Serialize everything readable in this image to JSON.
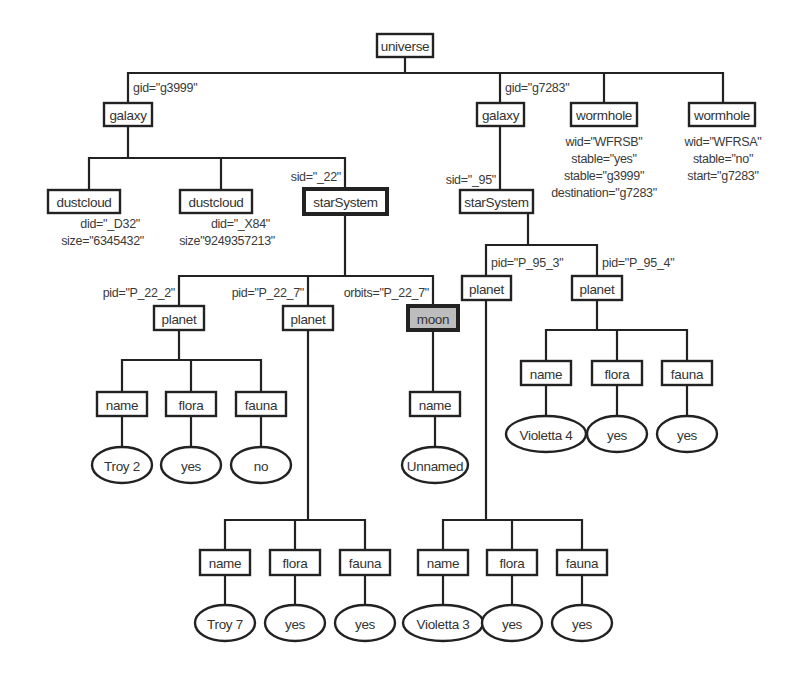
{
  "diagram": {
    "title": "",
    "colors": {
      "line": "#222222",
      "box_fill": "#ffffff",
      "highlight_fill": "#bdbdbd",
      "text": "#333333"
    },
    "nodes": [
      {
        "id": "universe",
        "label": "universe",
        "shape": "box",
        "x": 377,
        "y": 34,
        "w": 56,
        "h": 23
      },
      {
        "id": "galaxy1",
        "label": "galaxy",
        "shape": "box",
        "x": 104,
        "y": 103,
        "w": 48,
        "h": 23
      },
      {
        "id": "galaxy2",
        "label": "galaxy",
        "shape": "box",
        "x": 477,
        "y": 103,
        "w": 47,
        "h": 23
      },
      {
        "id": "wormhole1",
        "label": "wormhole",
        "shape": "box",
        "x": 571,
        "y": 103,
        "w": 66,
        "h": 23
      },
      {
        "id": "wormhole2",
        "label": "wormhole",
        "shape": "box",
        "x": 689,
        "y": 103,
        "w": 66,
        "h": 23
      },
      {
        "id": "dustcloud1",
        "label": "dustcloud",
        "shape": "box",
        "x": 48,
        "y": 190,
        "w": 72,
        "h": 23
      },
      {
        "id": "dustcloud2",
        "label": "dustcloud",
        "shape": "box",
        "x": 180,
        "y": 190,
        "w": 72,
        "h": 23
      },
      {
        "id": "starsystem1",
        "label": "starSystem",
        "shape": "box",
        "style": "bold",
        "x": 304,
        "y": 189,
        "w": 83,
        "h": 25
      },
      {
        "id": "starsystem2",
        "label": "starSystem",
        "shape": "box",
        "x": 460,
        "y": 190,
        "w": 73,
        "h": 23
      },
      {
        "id": "planet1",
        "label": "planet",
        "shape": "box",
        "x": 154,
        "y": 306,
        "w": 50,
        "h": 24
      },
      {
        "id": "planet2",
        "label": "planet",
        "shape": "box",
        "x": 283,
        "y": 306,
        "w": 50,
        "h": 24
      },
      {
        "id": "moon",
        "label": "moon",
        "shape": "box",
        "style": "shaded",
        "x": 408,
        "y": 306,
        "w": 50,
        "h": 24
      },
      {
        "id": "planet3",
        "label": "planet",
        "shape": "box",
        "x": 462,
        "y": 276,
        "w": 49,
        "h": 24
      },
      {
        "id": "planet4",
        "label": "planet",
        "shape": "box",
        "x": 572,
        "y": 276,
        "w": 50,
        "h": 24
      },
      {
        "id": "p1name",
        "label": "name",
        "shape": "box",
        "x": 97,
        "y": 392,
        "w": 50,
        "h": 24
      },
      {
        "id": "p1flora",
        "label": "flora",
        "shape": "box",
        "x": 166,
        "y": 392,
        "w": 50,
        "h": 24
      },
      {
        "id": "p1fauna",
        "label": "fauna",
        "shape": "box",
        "x": 236,
        "y": 392,
        "w": 50,
        "h": 24
      },
      {
        "id": "p1nameval",
        "label": "Troy 2",
        "shape": "oval",
        "cx": 122,
        "cy": 465,
        "rx": 30,
        "ry": 18
      },
      {
        "id": "p1floraval",
        "label": "yes",
        "shape": "oval",
        "cx": 191,
        "cy": 465,
        "rx": 30,
        "ry": 18
      },
      {
        "id": "p1faunaval",
        "label": "no",
        "shape": "oval",
        "cx": 261,
        "cy": 465,
        "rx": 30,
        "ry": 18
      },
      {
        "id": "moonname",
        "label": "name",
        "shape": "box",
        "x": 410,
        "y": 392,
        "w": 50,
        "h": 24
      },
      {
        "id": "moonnameval",
        "label": "Unnamed",
        "shape": "oval",
        "cx": 435,
        "cy": 465,
        "rx": 33,
        "ry": 18
      },
      {
        "id": "p4name",
        "label": "name",
        "shape": "box",
        "x": 521,
        "y": 361,
        "w": 50,
        "h": 24
      },
      {
        "id": "p4flora",
        "label": "flora",
        "shape": "box",
        "x": 592,
        "y": 361,
        "w": 50,
        "h": 24
      },
      {
        "id": "p4fauna",
        "label": "fauna",
        "shape": "box",
        "x": 662,
        "y": 361,
        "w": 50,
        "h": 24
      },
      {
        "id": "p4nameval",
        "label": "Violetta 4",
        "shape": "oval",
        "cx": 546,
        "cy": 434,
        "rx": 40,
        "ry": 18
      },
      {
        "id": "p4floraval",
        "label": "yes",
        "shape": "oval",
        "cx": 617,
        "cy": 434,
        "rx": 30,
        "ry": 18
      },
      {
        "id": "p4faunaval",
        "label": "yes",
        "shape": "oval",
        "cx": 687,
        "cy": 434,
        "rx": 30,
        "ry": 18
      },
      {
        "id": "p2name",
        "label": "name",
        "shape": "box",
        "x": 200,
        "y": 550,
        "w": 50,
        "h": 25
      },
      {
        "id": "p2flora",
        "label": "flora",
        "shape": "box",
        "x": 270,
        "y": 550,
        "w": 50,
        "h": 25
      },
      {
        "id": "p2fauna",
        "label": "fauna",
        "shape": "box",
        "x": 340,
        "y": 550,
        "w": 50,
        "h": 25
      },
      {
        "id": "p2nameval",
        "label": "Troy 7",
        "shape": "oval",
        "cx": 225,
        "cy": 623,
        "rx": 30,
        "ry": 18
      },
      {
        "id": "p2floraval",
        "label": "yes",
        "shape": "oval",
        "cx": 295,
        "cy": 623,
        "rx": 30,
        "ry": 18
      },
      {
        "id": "p2faunaval",
        "label": "yes",
        "shape": "oval",
        "cx": 365,
        "cy": 623,
        "rx": 30,
        "ry": 18
      },
      {
        "id": "p3name",
        "label": "name",
        "shape": "box",
        "x": 418,
        "y": 550,
        "w": 50,
        "h": 25
      },
      {
        "id": "p3flora",
        "label": "flora",
        "shape": "box",
        "x": 487,
        "y": 550,
        "w": 50,
        "h": 25
      },
      {
        "id": "p3fauna",
        "label": "fauna",
        "shape": "box",
        "x": 557,
        "y": 550,
        "w": 50,
        "h": 25
      },
      {
        "id": "p3nameval",
        "label": "Violetta 3",
        "shape": "oval",
        "cx": 443,
        "cy": 623,
        "rx": 40,
        "ry": 18
      },
      {
        "id": "p3floraval",
        "label": "yes",
        "shape": "oval",
        "cx": 512,
        "cy": 623,
        "rx": 30,
        "ry": 18
      },
      {
        "id": "p3faunaval",
        "label": "yes",
        "shape": "oval",
        "cx": 582,
        "cy": 623,
        "rx": 30,
        "ry": 18
      }
    ],
    "edges": [
      {
        "points": [
          [
            405,
            57
          ],
          [
            405,
            73
          ]
        ]
      },
      {
        "points": [
          [
            128,
            103
          ],
          [
            128,
            73
          ],
          [
            723,
            73
          ],
          [
            723,
            103
          ]
        ]
      },
      {
        "points": [
          [
            500,
            73
          ],
          [
            500,
            103
          ]
        ]
      },
      {
        "points": [
          [
            604,
            73
          ],
          [
            604,
            103
          ]
        ]
      },
      {
        "points": [
          [
            128,
            126
          ],
          [
            128,
            158
          ]
        ]
      },
      {
        "points": [
          [
            89,
            190
          ],
          [
            89,
            158
          ],
          [
            345,
            158
          ],
          [
            345,
            189
          ]
        ]
      },
      {
        "points": [
          [
            221,
            158
          ],
          [
            221,
            190
          ]
        ]
      },
      {
        "points": [
          [
            500,
            126
          ],
          [
            500,
            190
          ]
        ]
      },
      {
        "points": [
          [
            345,
            214
          ],
          [
            345,
            276
          ]
        ]
      },
      {
        "points": [
          [
            179,
            306
          ],
          [
            179,
            276
          ],
          [
            433,
            276
          ],
          [
            433,
            306
          ]
        ]
      },
      {
        "points": [
          [
            308,
            276
          ],
          [
            308,
            306
          ]
        ]
      },
      {
        "points": [
          [
            528,
            213
          ],
          [
            528,
            245
          ]
        ]
      },
      {
        "points": [
          [
            486,
            276
          ],
          [
            486,
            245
          ],
          [
            597,
            245
          ],
          [
            597,
            276
          ]
        ]
      },
      {
        "points": [
          [
            179,
            330
          ],
          [
            179,
            360
          ]
        ]
      },
      {
        "points": [
          [
            122,
            392
          ],
          [
            122,
            360
          ],
          [
            261,
            360
          ],
          [
            261,
            392
          ]
        ]
      },
      {
        "points": [
          [
            191,
            360
          ],
          [
            191,
            392
          ]
        ]
      },
      {
        "points": [
          [
            122,
            416
          ],
          [
            122,
            447
          ]
        ]
      },
      {
        "points": [
          [
            191,
            416
          ],
          [
            191,
            447
          ]
        ]
      },
      {
        "points": [
          [
            261,
            416
          ],
          [
            261,
            447
          ]
        ]
      },
      {
        "points": [
          [
            433,
            330
          ],
          [
            433,
            392
          ]
        ]
      },
      {
        "points": [
          [
            435,
            416
          ],
          [
            435,
            447
          ]
        ]
      },
      {
        "points": [
          [
            597,
            300
          ],
          [
            597,
            330
          ]
        ]
      },
      {
        "points": [
          [
            546,
            361
          ],
          [
            546,
            330
          ],
          [
            687,
            330
          ],
          [
            687,
            361
          ]
        ]
      },
      {
        "points": [
          [
            617,
            330
          ],
          [
            617,
            361
          ]
        ]
      },
      {
        "points": [
          [
            546,
            385
          ],
          [
            546,
            416
          ]
        ]
      },
      {
        "points": [
          [
            617,
            385
          ],
          [
            617,
            416
          ]
        ]
      },
      {
        "points": [
          [
            687,
            385
          ],
          [
            687,
            416
          ]
        ]
      },
      {
        "points": [
          [
            308,
            330
          ],
          [
            308,
            520
          ]
        ]
      },
      {
        "points": [
          [
            225,
            550
          ],
          [
            225,
            520
          ],
          [
            365,
            520
          ],
          [
            365,
            550
          ]
        ]
      },
      {
        "points": [
          [
            295,
            520
          ],
          [
            295,
            550
          ]
        ]
      },
      {
        "points": [
          [
            225,
            575
          ],
          [
            225,
            605
          ]
        ]
      },
      {
        "points": [
          [
            295,
            575
          ],
          [
            295,
            605
          ]
        ]
      },
      {
        "points": [
          [
            365,
            575
          ],
          [
            365,
            605
          ]
        ]
      },
      {
        "points": [
          [
            486,
            300
          ],
          [
            486,
            520
          ]
        ]
      },
      {
        "points": [
          [
            443,
            550
          ],
          [
            443,
            520
          ],
          [
            582,
            520
          ],
          [
            582,
            550
          ]
        ]
      },
      {
        "points": [
          [
            512,
            520
          ],
          [
            512,
            550
          ]
        ]
      },
      {
        "points": [
          [
            443,
            575
          ],
          [
            443,
            605
          ]
        ]
      },
      {
        "points": [
          [
            512,
            575
          ],
          [
            512,
            605
          ]
        ]
      },
      {
        "points": [
          [
            582,
            575
          ],
          [
            582,
            605
          ]
        ]
      }
    ],
    "attributes": [
      {
        "text": "gid=\"g3999\"",
        "x": 133,
        "y": 92,
        "anchor": "start"
      },
      {
        "text": "gid=\"g7283\"",
        "x": 505,
        "y": 92,
        "anchor": "start"
      },
      {
        "text": "wid=\"WFRSB\"",
        "x": 604,
        "y": 146,
        "anchor": "middle"
      },
      {
        "text": "stable=\"yes\"",
        "x": 604,
        "y": 163,
        "anchor": "middle"
      },
      {
        "text": "stable=\"g3999\"",
        "x": 604,
        "y": 180,
        "anchor": "middle"
      },
      {
        "text": "destination=\"g7283\"",
        "x": 604,
        "y": 197,
        "anchor": "middle"
      },
      {
        "text": "wid=\"WFRSA\"",
        "x": 723,
        "y": 146,
        "anchor": "middle"
      },
      {
        "text": "stable=\"no\"",
        "x": 723,
        "y": 163,
        "anchor": "middle"
      },
      {
        "text": "start=\"g7283\"",
        "x": 723,
        "y": 180,
        "anchor": "middle"
      },
      {
        "text": "sid=\"_22\"",
        "x": 341,
        "y": 181,
        "anchor": "end"
      },
      {
        "text": "sid=\"_95\"",
        "x": 496,
        "y": 184,
        "anchor": "end"
      },
      {
        "text": "did=\"_D32\"",
        "x": 140,
        "y": 228,
        "anchor": "end"
      },
      {
        "text": "size=\"6345432\"",
        "x": 144,
        "y": 245,
        "anchor": "end"
      },
      {
        "text": "did=\"_X84\"",
        "x": 270,
        "y": 228,
        "anchor": "end"
      },
      {
        "text": "size\"9249357213\"",
        "x": 275,
        "y": 245,
        "anchor": "end"
      },
      {
        "text": "pid=\"P_22_2\"",
        "x": 175,
        "y": 297,
        "anchor": "end"
      },
      {
        "text": "pid=\"P_22_7\"",
        "x": 304,
        "y": 297,
        "anchor": "end"
      },
      {
        "text": "orbits=\"P_22_7\"",
        "x": 429,
        "y": 297,
        "anchor": "end"
      },
      {
        "text": "pid=\"P_95_3\"",
        "x": 491,
        "y": 267,
        "anchor": "start"
      },
      {
        "text": "pid=\"P_95_4\"",
        "x": 602,
        "y": 267,
        "anchor": "start"
      }
    ]
  }
}
